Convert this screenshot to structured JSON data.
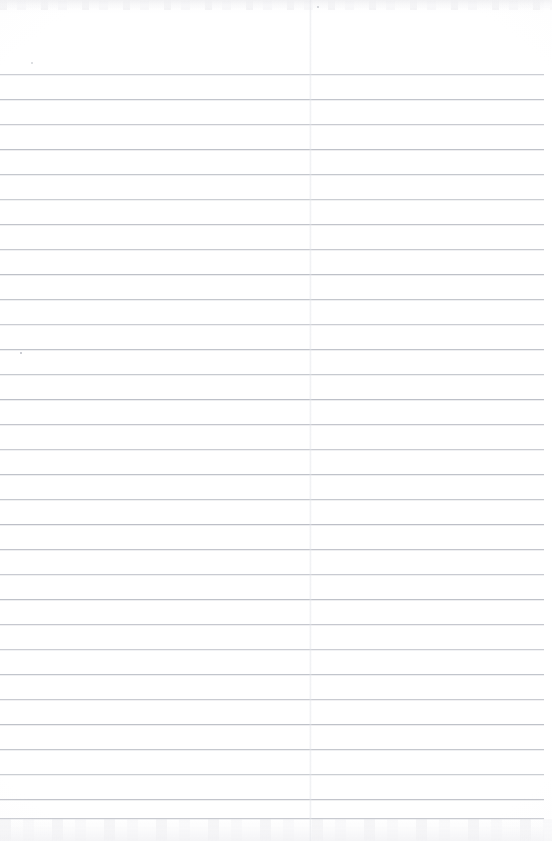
{
  "document": {
    "kind": "scanned-lined-notebook-page",
    "title": "Blank Ruled Notebook Page",
    "page_width": 552,
    "page_height": 841,
    "background_color": "#ffffff",
    "paper_tint": "#fdfdfe",
    "has_text_content": false,
    "text_content": "",
    "orientation": "portrait"
  },
  "ruling": {
    "style": "horizontal-ruled",
    "line_color": "#b9bcc4",
    "line_thickness_px": 1,
    "line_spacing_px": 25,
    "first_line_y": 74,
    "last_line_y": 818,
    "line_count": 30,
    "line_start_x": 0,
    "line_end_x": 544,
    "line_y_positions": [
      74,
      99,
      124,
      149,
      174,
      199,
      224,
      249,
      274,
      299,
      324,
      349,
      374,
      399,
      424,
      449,
      474,
      499,
      524,
      549,
      574,
      599,
      624,
      649,
      674,
      699,
      724,
      749,
      774,
      799,
      818
    ]
  },
  "margins": {
    "top_unruled_height": 74,
    "right_unruled_width": 8,
    "left_unruled_width": 0,
    "bottom_unruled_height": 23
  },
  "artifacts": {
    "fold_crease": {
      "name": "vertical-fold-crease",
      "x": 309,
      "width": 3,
      "color": "#e2e4e9",
      "opacity": 0.55
    },
    "top_scan_band": {
      "name": "top-scan-shadow",
      "y": 0,
      "height": 10,
      "color": "#e4e4e8"
    },
    "bottom_scan_band": {
      "name": "bottom-scan-shadow",
      "y": 819,
      "height": 22,
      "color": "#eaeaee"
    },
    "specks": [
      {
        "x": 20,
        "y": 352,
        "color": "#babdc4"
      },
      {
        "x": 317,
        "y": 6,
        "color": "#c6c8ce"
      },
      {
        "x": 31,
        "y": 62,
        "color": "#d2d4d9"
      }
    ]
  }
}
